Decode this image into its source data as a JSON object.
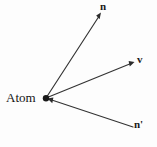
{
  "figure": {
    "background_color": "#fdfdfd",
    "stroke_color": "#333333",
    "label_color": "#1a1a1a",
    "width": 157,
    "height": 147
  },
  "origin": {
    "label": "Atom",
    "x": 46,
    "y": 98,
    "dot_radius": 3.2
  },
  "vectors": [
    {
      "name": "n",
      "label": "n",
      "from": {
        "x": 46,
        "y": 98
      },
      "to": {
        "x": 101,
        "y": 13
      },
      "arrow_at": "to",
      "label_x": 100,
      "label_y": 1,
      "bold": true
    },
    {
      "name": "v",
      "label": "v",
      "from": {
        "x": 46,
        "y": 98
      },
      "to": {
        "x": 134,
        "y": 62
      },
      "arrow_at": "to",
      "label_x": 137,
      "label_y": 54,
      "bold": true
    },
    {
      "name": "n-prime",
      "label": "n'",
      "from": {
        "x": 133,
        "y": 127
      },
      "to": {
        "x": 48,
        "y": 99
      },
      "arrow_at": "to",
      "label_x": 134,
      "label_y": 119,
      "bold": true
    }
  ]
}
